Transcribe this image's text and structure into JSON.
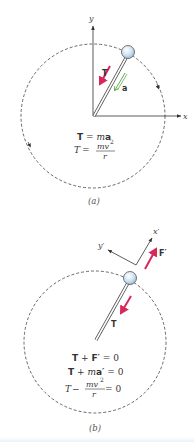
{
  "figure": {
    "panel_a": {
      "caption": "(a)",
      "axes": {
        "x_label": "x",
        "y_label": "y"
      },
      "vectors": {
        "tension_label": "T",
        "acceleration_label": "a"
      },
      "equations": {
        "eq1": {
          "lhs": "T",
          "eq": " = ",
          "rhs_italic": "m",
          "rhs_bold": "a"
        },
        "eq2": {
          "lhs": "T",
          "eq": " = ",
          "num": "mv",
          "exp": "2",
          "den": "r"
        }
      }
    },
    "panel_b": {
      "caption": "(b)",
      "axes": {
        "x_label": "x′",
        "y_label": "y′"
      },
      "vectors": {
        "tension_label": "T",
        "fictitious_force_label": "F′"
      },
      "equations": {
        "eq1": {
          "a": "T",
          "op": " + ",
          "b": "F′",
          "rhs": " = 0"
        },
        "eq2": {
          "a": "T",
          "op": " + ",
          "m": "m",
          "b": "a′",
          "rhs": " = 0"
        },
        "eq3": {
          "a": "T",
          "op": " − ",
          "num": "mv",
          "exp": "2",
          "den": "r",
          "rhs": " = 0"
        }
      }
    },
    "colors": {
      "tension_arrow": "#d8275a",
      "acceleration_arrow": "#4ca63a",
      "circle_path": "#444444",
      "axes": "#333333",
      "ball_fill": "#cfe3f2",
      "ball_stroke": "#555555"
    }
  }
}
